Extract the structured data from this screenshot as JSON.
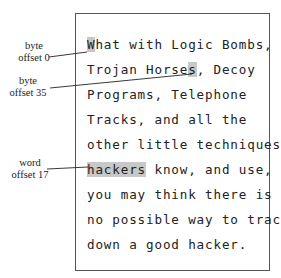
{
  "text_lines": [
    {
      "pre": "",
      "hl": "W",
      "post": "hat with Logic Bombs,"
    },
    {
      "pre": "Trojan Horse",
      "hl": "s",
      "post": ", Decoy"
    },
    {
      "pre": "Programs, Telephone",
      "hl": "",
      "post": ""
    },
    {
      "pre": "Tracks, and all the",
      "hl": "",
      "post": ""
    },
    {
      "pre": "other little techniques",
      "hl": "",
      "post": ""
    },
    {
      "pre": "",
      "hl": "hackers",
      "post": " know, and use,"
    },
    {
      "pre": "you may think there is",
      "hl": "",
      "post": ""
    },
    {
      "pre": "no possible way to track",
      "hl": "",
      "post": ""
    },
    {
      "pre": "down a good hacker.",
      "hl": "",
      "post": ""
    }
  ],
  "annotations": [
    {
      "line1": "byte",
      "line2": "offset 0"
    },
    {
      "line1": "byte",
      "line2": "offset 35"
    },
    {
      "line1": "word",
      "line2": "offset 17"
    }
  ],
  "colors": {
    "highlight": "#c8c8c8",
    "border": "#555555"
  }
}
